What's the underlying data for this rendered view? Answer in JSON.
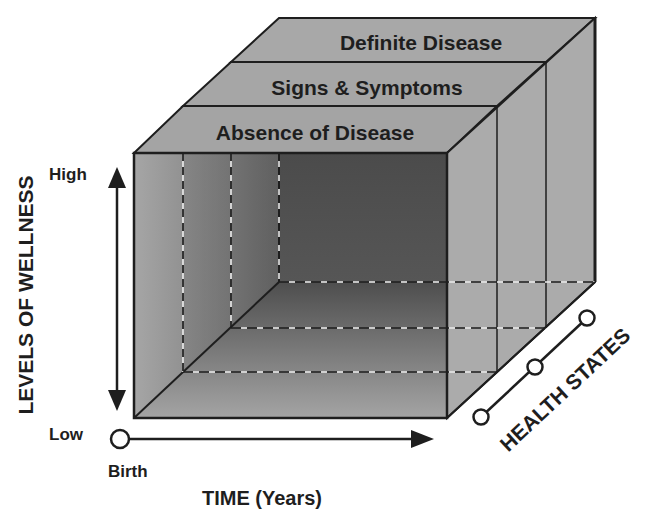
{
  "diagram": {
    "type": "3d-cube-health-model",
    "layers": [
      {
        "label": "Definite Disease",
        "order": 3
      },
      {
        "label": "Signs & Symptoms",
        "order": 2
      },
      {
        "label": "Absence of Disease",
        "order": 1
      }
    ],
    "y_axis": {
      "title": "LEVELS OF WELLNESS",
      "high_label": "High",
      "low_label": "Low"
    },
    "x_axis": {
      "title": "TIME (Years)",
      "start_label": "Birth"
    },
    "z_axis": {
      "title": "HEALTH STATES",
      "node_count": 3
    },
    "colors": {
      "face_light": "#a9a9a9",
      "face_top": "#a4a4a4",
      "face_dark": "#4a4a4a",
      "line": "#1e1e1e",
      "dash_light": "#e8e8e8"
    }
  }
}
